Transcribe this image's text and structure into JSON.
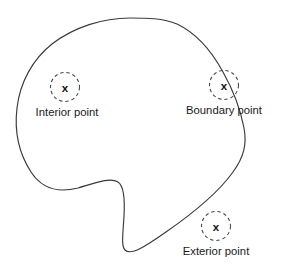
{
  "canvas": {
    "width": 281,
    "height": 267,
    "background_color": "#ffffff"
  },
  "figure": {
    "type": "topology-point-classification",
    "stroke_color": "#3a3a3a",
    "marker_stroke_color": "#4a4a4a",
    "text_color": "#1a1a1a"
  },
  "region": {
    "name": "closed-region-outline",
    "path": "M 130 18 C 103 18 74 27 52 44 C 33 59 20 82 17 108 C 14 133 20 155 31 172 C 44 192 62 192 78 188 C 95 183 110 177 118 182 C 124 186 125 199 124 216 C 123 234 121 246 125 250 C 131 256 146 246 166 232 C 192 214 218 193 233 172 C 244 157 247 144 244 128 C 240 107 232 88 223 72 C 211 50 196 33 177 24 C 163 18 146 18 130 18 Z"
  },
  "markers": [
    {
      "id": "interior",
      "name": "interior-point",
      "glyph": "x",
      "cx": 65,
      "cy": 87,
      "r": 14.5,
      "label": "Interior point",
      "label_x": 67,
      "label_y": 116
    },
    {
      "id": "boundary",
      "name": "boundary-point",
      "glyph": "x",
      "cx": 224,
      "cy": 85,
      "r": 14.5,
      "label": "Boundary point",
      "label_x": 224,
      "label_y": 114
    },
    {
      "id": "exterior",
      "name": "exterior-point",
      "glyph": "x",
      "cx": 216,
      "cy": 226,
      "r": 14.5,
      "label": "Exterior point",
      "label_x": 216,
      "label_y": 255
    }
  ]
}
